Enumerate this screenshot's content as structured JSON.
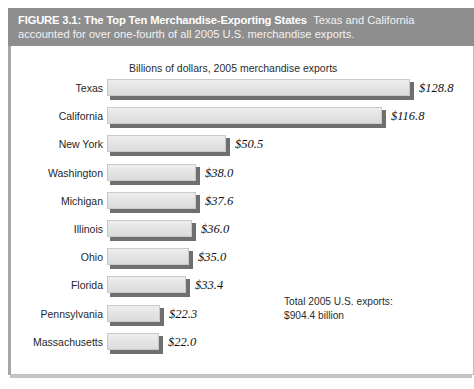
{
  "figure": {
    "number_label": "FIGURE 3.1:",
    "title": "The Top Ten Merchandise-Exporting States",
    "caption_lead": "Texas and California",
    "caption_line2": "accounted for over one-fourth of all 2005 U.S. merchandise exports.",
    "header_bg": "#8e8e8e",
    "header_text_color": "#ffffff"
  },
  "chart_data": {
    "type": "bar",
    "orientation": "horizontal",
    "title": "The Top Ten Merchandise-Exporting States",
    "subtitle": "Billions of dollars, 2005 merchandise exports",
    "xlabel": "",
    "ylabel": "",
    "xlim": [
      0,
      128.8
    ],
    "grid": false,
    "legend": false,
    "bar_color": "#e4e4e4",
    "bar_shadow_color": "#6f6f6f",
    "categories": [
      "Texas",
      "California",
      "New York",
      "Washington",
      "Michigan",
      "Illinois",
      "Ohio",
      "Florida",
      "Pennsylvania",
      "Massachusetts"
    ],
    "values": [
      128.8,
      116.8,
      50.5,
      38.0,
      37.6,
      36.0,
      35.0,
      33.4,
      22.3,
      22.0
    ],
    "value_labels": [
      "$128.8",
      "$116.8",
      "$50.5",
      "$38.0",
      "$37.6",
      "$36.0",
      "$35.0",
      "$33.4",
      "$22.3",
      "$22.0"
    ],
    "annotations": [
      "Total 2005 U.S. exports:",
      "$904.4 billion"
    ]
  },
  "annotation": {
    "line1": "Total 2005 U.S. exports:",
    "line2": "$904.4 billion"
  },
  "source": {
    "text": ""
  }
}
